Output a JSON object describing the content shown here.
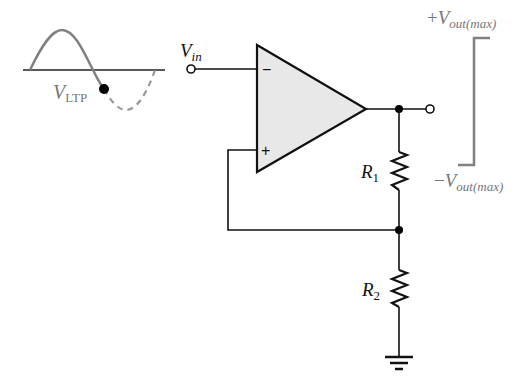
{
  "diagram": {
    "input_waveform": {
      "label_main": "V",
      "label_sub": "LTP",
      "color": "#808080"
    },
    "input": {
      "label_main": "V",
      "label_sub": "in"
    },
    "opamp": {
      "inverting_symbol": "−",
      "noninverting_symbol": "+",
      "fill": "#e8e8e8"
    },
    "resistors": [
      {
        "label_main": "R",
        "label_sub": "1"
      },
      {
        "label_main": "R",
        "label_sub": "2"
      }
    ],
    "output_waveform": {
      "top_prefix": "+",
      "top_main": "V",
      "top_sub": "out(max)",
      "bottom_prefix": "−",
      "bottom_main": "V",
      "bottom_sub": "out(max)",
      "color": "#808080"
    }
  }
}
